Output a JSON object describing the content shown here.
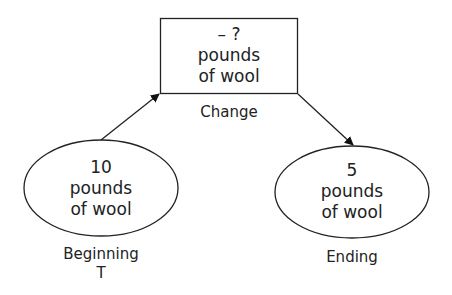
{
  "diagram": {
    "change": {
      "lines": [
        "– ?",
        "pounds",
        "of wool"
      ],
      "label": "Change"
    },
    "beginning": {
      "lines": [
        "10",
        "pounds",
        "of wool"
      ],
      "label": "Beginning",
      "sublabel": "T"
    },
    "ending": {
      "lines": [
        "5",
        "pounds",
        "of wool"
      ],
      "label": "Ending"
    },
    "stroke_color": "#222222"
  }
}
